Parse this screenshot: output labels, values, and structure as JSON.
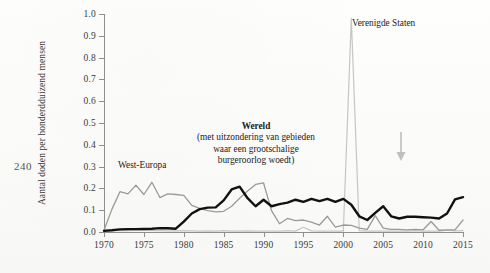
{
  "page": {
    "folio": "240"
  },
  "chart_data": {
    "type": "line",
    "title": "",
    "xlabel": "",
    "ylabel": "Aantal doden per honderdduizend mensen",
    "xlim": [
      1970,
      2015
    ],
    "ylim": [
      0.0,
      1.0
    ],
    "grid": false,
    "legend_position": "inline-annotations",
    "ytick_labels": [
      "0.0",
      "0.1",
      "0.2",
      "0.3",
      "0.4",
      "0.5",
      "0.6",
      "0.7",
      "0.8",
      "0.9",
      "1.0"
    ],
    "ytick_values": [
      0.0,
      0.1,
      0.2,
      0.3,
      0.4,
      0.5,
      0.6,
      0.7,
      0.8,
      0.9,
      1.0
    ],
    "xtick_labels": [
      "1970",
      "1975",
      "1980",
      "1985",
      "1990",
      "1995",
      "2000",
      "2005",
      "2010",
      "2015"
    ],
    "xtick_values": [
      1970,
      1975,
      1980,
      1985,
      1990,
      1995,
      2000,
      2005,
      2010,
      2015
    ],
    "x": [
      1970,
      1971,
      1972,
      1973,
      1974,
      1975,
      1976,
      1977,
      1978,
      1979,
      1980,
      1981,
      1982,
      1983,
      1984,
      1985,
      1986,
      1987,
      1988,
      1989,
      1990,
      1991,
      1992,
      1993,
      1994,
      1995,
      1996,
      1997,
      1998,
      1999,
      2000,
      2001,
      2002,
      2003,
      2004,
      2005,
      2006,
      2007,
      2008,
      2009,
      2010,
      2011,
      2012,
      2013,
      2014,
      2015
    ],
    "series": [
      {
        "name": "Wereld",
        "color": "#111111",
        "annotation": "Wereld (met uitzondering van gebieden waar een grootschalige burgeroorlog woedt)",
        "values": [
          0.005,
          0.008,
          0.012,
          0.013,
          0.013,
          0.014,
          0.015,
          0.018,
          0.017,
          0.015,
          0.048,
          0.085,
          0.105,
          0.112,
          0.113,
          0.145,
          0.195,
          0.208,
          0.155,
          0.118,
          0.148,
          0.118,
          0.128,
          0.135,
          0.148,
          0.138,
          0.152,
          0.142,
          0.152,
          0.138,
          0.152,
          0.125,
          0.072,
          0.055,
          0.088,
          0.118,
          0.072,
          0.062,
          0.07,
          0.07,
          0.068,
          0.066,
          0.062,
          0.085,
          0.15,
          0.16
        ]
      },
      {
        "name": "West-Europa",
        "color": "#9a9a9a",
        "annotation": "West-Europa",
        "values": [
          0.008,
          0.105,
          0.185,
          0.175,
          0.215,
          0.172,
          0.228,
          0.158,
          0.175,
          0.172,
          0.168,
          0.122,
          0.108,
          0.098,
          0.092,
          0.095,
          0.118,
          0.155,
          0.188,
          0.218,
          0.225,
          0.098,
          0.038,
          0.062,
          0.052,
          0.055,
          0.045,
          0.032,
          0.072,
          0.022,
          0.032,
          0.03,
          0.018,
          0.012,
          0.075,
          0.018,
          0.012,
          0.012,
          0.01,
          0.012,
          0.01,
          0.048,
          0.008,
          0.01,
          0.01,
          0.055
        ]
      },
      {
        "name": "Verenigde Staten",
        "color": "#c6c6c6",
        "annotation": "Verenigde Staten",
        "values": [
          0.01,
          0.008,
          0.006,
          0.006,
          0.008,
          0.01,
          0.006,
          0.006,
          0.005,
          0.005,
          0.006,
          0.005,
          0.004,
          0.005,
          0.004,
          0.006,
          0.004,
          0.004,
          0.005,
          0.004,
          0.004,
          0.004,
          0.004,
          0.006,
          0.004,
          0.022,
          0.005,
          0.004,
          0.004,
          0.004,
          0.004,
          0.98,
          0.006,
          0.004,
          0.004,
          0.004,
          0.004,
          0.004,
          0.004,
          0.006,
          0.004,
          0.004,
          0.004,
          0.008,
          0.005,
          0.006
        ]
      }
    ],
    "annotations": [
      {
        "name": "arrow-marker",
        "x": 2007,
        "y": 0.12,
        "label": ""
      }
    ]
  }
}
